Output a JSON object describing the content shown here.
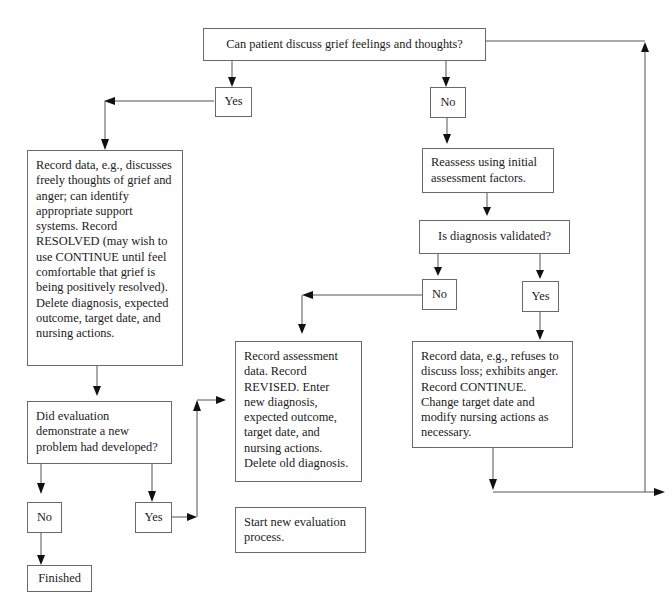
{
  "flowchart": {
    "start_question": "Can patient discuss grief feelings and thoughts?",
    "branch_yes": "Yes",
    "branch_no": "No",
    "resolved_box": "Record data, e.g., discusses freely thoughts of grief and anger; can identify appropriate support systems. Record RESOLVED (may wish to use CONTINUE until feel comfortable that grief is being positively resolved). Delete diagnosis, expected outcome, target date, and nursing actions.",
    "reassess_box": "Reassess using initial assessment factors.",
    "validated_question": "Is diagnosis validated?",
    "validated_no": "No",
    "validated_yes": "Yes",
    "revised_box": "Record assessment data. Record REVISED. Enter new diagnosis, expected outcome, target date, and nursing actions. Delete old diagnosis.",
    "continue_box": "Record data, e.g., refuses to discuss loss; exhibits anger. Record CONTINUE. Change target date and modify nursing actions as necessary.",
    "new_problem_question": "Did evaluation demonstrate a new problem had developed?",
    "new_problem_no": "No",
    "new_problem_yes": "Yes",
    "new_eval_box": "Start new evaluation process.",
    "finished_box": "Finished"
  }
}
